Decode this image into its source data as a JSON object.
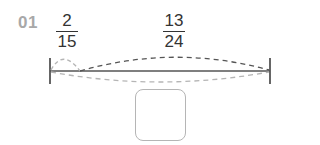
{
  "problem": {
    "number": "01",
    "fraction_left": {
      "numerator": "2",
      "denominator": "15"
    },
    "fraction_right": {
      "numerator": "13",
      "denominator": "24"
    },
    "answer_box": {
      "value": ""
    }
  },
  "colors": {
    "number_label": "#a8a8a8",
    "text": "#333333",
    "line": "#555555",
    "arc_dark": "#555555",
    "arc_light": "#b5b5b5",
    "box_border": "#b5b5b5"
  }
}
